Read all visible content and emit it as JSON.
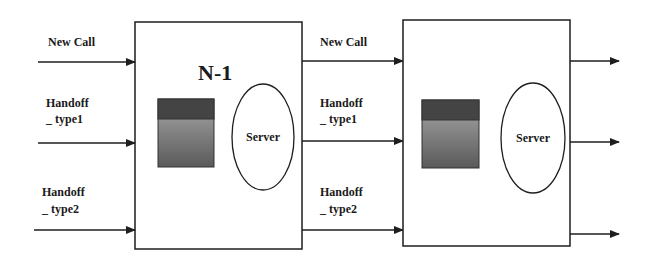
{
  "diagram": {
    "colors": {
      "line": "#1e1e1e",
      "queue_top": "#444444",
      "queue_gradient_top": "#a8a8a8",
      "queue_gradient_bottom": "#5a5a5a",
      "box_fill": "#ffffff"
    },
    "cell1": {
      "title": "N-1",
      "server_label": "Server",
      "inputs": [
        {
          "line1": "New Call",
          "line2": ""
        },
        {
          "line1": "Handoff",
          "line2": "_ type1"
        },
        {
          "line1": "Handoff",
          "line2": "_ type2"
        }
      ]
    },
    "cell2": {
      "title": "",
      "server_label": "Server",
      "inputs": [
        {
          "line1": "New Call",
          "line2": ""
        },
        {
          "line1": "Handoff",
          "line2": "_ type1"
        },
        {
          "line1": "Handoff",
          "line2": "_ type2"
        }
      ]
    }
  }
}
